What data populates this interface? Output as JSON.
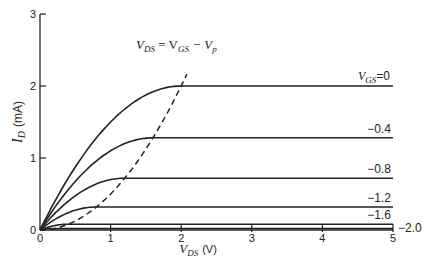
{
  "chart_data": {
    "type": "line",
    "title": "",
    "xlabel": "V_DS (V)",
    "ylabel": "I_D (mA)",
    "xlim": [
      0,
      5
    ],
    "ylim": [
      0,
      3
    ],
    "x_ticks": [
      "0",
      "1",
      "2",
      "3",
      "4",
      "5"
    ],
    "y_ticks": [
      "0",
      "1",
      "2",
      "3"
    ],
    "grid": false,
    "params": {
      "IDSS_mA": 2.0,
      "Vp_V": -2.0
    },
    "series": [
      {
        "name": "V_GS = 0",
        "label": "0",
        "vgs": 0,
        "saturation_mA": 2.0,
        "pinchoff_vds": 2.0
      },
      {
        "name": "V_GS = -0.4",
        "label": "−0.4",
        "vgs": -0.4,
        "saturation_mA": 1.28,
        "pinchoff_vds": 1.6
      },
      {
        "name": "V_GS = -0.8",
        "label": "−0.8",
        "vgs": -0.8,
        "saturation_mA": 0.72,
        "pinchoff_vds": 1.2
      },
      {
        "name": "V_GS = -1.2",
        "label": "−1.2",
        "vgs": -1.2,
        "saturation_mA": 0.32,
        "pinchoff_vds": 0.8
      },
      {
        "name": "V_GS = -1.6",
        "label": "−1.6",
        "vgs": -1.6,
        "saturation_mA": 0.08,
        "pinchoff_vds": 0.4
      },
      {
        "name": "V_GS = -2.0",
        "label": "−2.0",
        "vgs": -2.0,
        "saturation_mA": 0.0,
        "pinchoff_vds": 0.0
      }
    ],
    "locus": {
      "name": "V_DS = V_GS - V_p",
      "style": "dashed",
      "equation": "I_D = IDSS * (V_DS / |V_p|)^2",
      "vds_max": 2.08
    },
    "annotations": [
      {
        "text": "V_DS = V_GS − V_p",
        "position": "above dashed locus"
      },
      {
        "text": "V_GS = 0",
        "position": "right end of top curve"
      }
    ]
  },
  "labels": {
    "locus_label_main": "V",
    "locus_label_sub1": "DS",
    "locus_label_eq": " = V",
    "locus_label_sub2": "GS",
    "locus_label_minus": " − V",
    "locus_label_sub3": "p",
    "vgs_prefix": "V",
    "vgs_sub": "GS",
    "vgs_value": "=0",
    "y_axis_main": "I",
    "y_axis_sub": "D",
    "y_axis_unit": "(mA)",
    "x_axis_main": "V",
    "x_axis_sub": "DS",
    "x_axis_unit": "(V)",
    "origin_x": "0",
    "origin_y": "0"
  }
}
